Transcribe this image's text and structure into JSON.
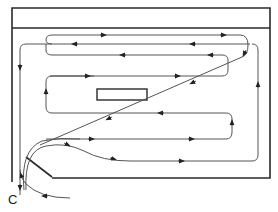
{
  "diagram": {
    "title": "",
    "type": "airflow-circulation-plan",
    "colors": {
      "frame": "#2a2a2a",
      "flow": "#555555",
      "background": "#ffffff"
    },
    "labels": {
      "exit": "C"
    },
    "elements": {
      "outer_frame": "room outline",
      "header_band": "top band",
      "central_obstacle": "rectangle in center",
      "inlet_wall": "angled wall bottom-left"
    }
  }
}
